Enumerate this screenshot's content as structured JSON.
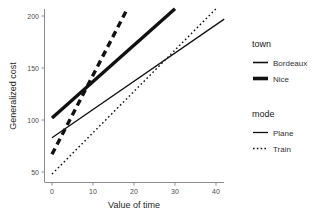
{
  "chart_data": {
    "type": "line",
    "title": "",
    "xlabel": "Value of time",
    "ylabel": "Generalized cost",
    "xlim": [
      -2,
      42
    ],
    "ylim": [
      45,
      210
    ],
    "xticks": [
      0,
      10,
      20,
      30,
      40
    ],
    "yticks": [
      50,
      100,
      150,
      200
    ],
    "grid": false,
    "legends": [
      {
        "title": "town",
        "entries": [
          {
            "label": "Bordeaux",
            "style": "thin"
          },
          {
            "label": "Nice",
            "style": "thick"
          }
        ]
      },
      {
        "title": "mode",
        "entries": [
          {
            "label": "Plane",
            "style": "solid"
          },
          {
            "label": "Train",
            "style": "dotted"
          }
        ]
      }
    ],
    "series": [
      {
        "name": "Bordeaux / Plane",
        "town": "Bordeaux",
        "mode": "Plane",
        "linewidth": "thin",
        "dash": "solid",
        "x": [
          0,
          42
        ],
        "y": [
          83,
          197
        ]
      },
      {
        "name": "Bordeaux / Train",
        "town": "Bordeaux",
        "mode": "Train",
        "linewidth": "thin",
        "dash": "dotted",
        "x": [
          0,
          40
        ],
        "y": [
          48,
          207
        ]
      },
      {
        "name": "Nice / Plane",
        "town": "Nice",
        "mode": "Plane",
        "linewidth": "thick",
        "dash": "solid",
        "x": [
          0,
          30
        ],
        "y": [
          102,
          207
        ]
      },
      {
        "name": "Nice / Train",
        "town": "Nice",
        "mode": "Train",
        "linewidth": "thick",
        "dash": "dashed",
        "x": [
          0,
          18
        ],
        "y": [
          67,
          204
        ]
      }
    ],
    "colors": {
      "line": "#111111",
      "axis": "#8c8c8c",
      "text": "#262626",
      "background": "#ffffff"
    }
  }
}
